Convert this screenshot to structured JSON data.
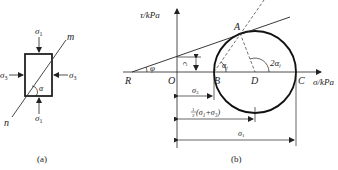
{
  "panel_a": {
    "caption": "(a)",
    "sigma1_top": "σ",
    "sigma1_top_sub": "1",
    "sigma1_bottom": "σ",
    "sigma1_bottom_sub": "1",
    "sigma3_left": "σ",
    "sigma3_left_sub": "3",
    "sigma3_right": "σ",
    "sigma3_right_sub": "3",
    "plane_end_top": "m",
    "plane_end_bottom": "n",
    "angle": "α"
  },
  "panel_b": {
    "caption": "(b)",
    "y_axis_label": "τ/kPa",
    "x_axis_label": "σ/kPa",
    "points": {
      "R": "R",
      "O": "O",
      "B": "B",
      "D": "D",
      "C": "C",
      "A": "A"
    },
    "phi": "φ",
    "cohesion": "c",
    "alpha_f": "α",
    "alpha_f_sub": "f",
    "two_alpha_f": "2α",
    "two_alpha_f_sub": "f",
    "dim_sigma3": "σ",
    "dim_sigma3_sub": "3",
    "dim_half_sum": "(σ₁+σ₃)",
    "dim_half_num": "1",
    "dim_half_den": "2",
    "dim_sigma1": "σ",
    "dim_sigma1_sub": "1"
  }
}
